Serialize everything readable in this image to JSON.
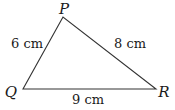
{
  "figure": {
    "type": "triangle",
    "vertices": [
      {
        "name": "P",
        "x": 63,
        "y": 17,
        "label_x": 64,
        "label_y": 14
      },
      {
        "name": "Q",
        "x": 23,
        "y": 89,
        "label_x": 11,
        "label_y": 97
      },
      {
        "name": "R",
        "x": 156,
        "y": 89,
        "label_x": 164,
        "label_y": 97
      }
    ],
    "sides": [
      {
        "from": "P",
        "to": "Q",
        "label": "6 cm",
        "label_x": 27,
        "label_y": 48
      },
      {
        "from": "P",
        "to": "R",
        "label": "8 cm",
        "label_x": 130,
        "label_y": 48
      },
      {
        "from": "Q",
        "to": "R",
        "label": "9 cm",
        "label_x": 88,
        "label_y": 104
      }
    ],
    "stroke_color": "#333333",
    "text_color": "#1a1a1a"
  }
}
